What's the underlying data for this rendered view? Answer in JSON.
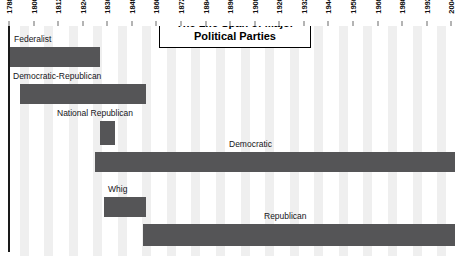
{
  "chart_data": {
    "type": "bar",
    "orientation": "horizontal-timeline",
    "title": "The Life Span of Major Political Parties",
    "xlabel": "",
    "ylabel": "",
    "xlim": [
      1788,
      2010
    ],
    "grid": true,
    "grid_style": "vertical alternating light bands",
    "legend": "none (inline labels above each bar)",
    "tick_interval_years": 12,
    "tick_labels": [
      "1788",
      "1800",
      "1812",
      "1824",
      "1836",
      "1848",
      "1860",
      "1872",
      "1884",
      "1896",
      "1908",
      "1920",
      "1932",
      "1944",
      "1956",
      "1968",
      "1980",
      "1992",
      "2004"
    ],
    "tick_values": [
      1788,
      1800,
      1812,
      1824,
      1836,
      1848,
      1860,
      1872,
      1884,
      1896,
      1908,
      1920,
      1932,
      1944,
      1956,
      1968,
      1980,
      1992,
      2004
    ],
    "bar_color": "#555557",
    "band_color": "#efefef",
    "background_color": "#ffffff",
    "categories": [
      "Federalist",
      "Democratic-Republican",
      "National Republican",
      "Democratic",
      "Whig",
      "Republican"
    ],
    "series": [
      {
        "name": "Life span",
        "spans": [
          {
            "label": "Federalist",
            "start": 1789,
            "end": 1832,
            "row": 0
          },
          {
            "label": "Democratic-Republican",
            "start": 1792,
            "end": 1824,
            "row": 1
          },
          {
            "label": "National Republican",
            "start": 1828,
            "end": 1834,
            "row": 2
          },
          {
            "label": "Democratic",
            "start": 1828,
            "end": 2008,
            "row": 3
          },
          {
            "label": "Whig",
            "start": 1834,
            "end": 1856,
            "row": 4
          },
          {
            "label": "Republican",
            "start": 1854,
            "end": 2008,
            "row": 5
          }
        ]
      }
    ],
    "annotations": [
      {
        "text": "The Life Span of Major Political Parties",
        "type": "title-box"
      }
    ]
  },
  "axis": {
    "ticks": [
      {
        "label": "1788",
        "x": 9
      },
      {
        "label": "1800",
        "x": 34
      },
      {
        "label": "1812",
        "x": 58
      },
      {
        "label": "1824",
        "x": 83
      },
      {
        "label": "1836",
        "x": 107
      },
      {
        "label": "1848",
        "x": 132
      },
      {
        "label": "1860",
        "x": 156
      },
      {
        "label": "1872",
        "x": 181
      },
      {
        "label": "1884",
        "x": 206
      },
      {
        "label": "1896",
        "x": 230
      },
      {
        "label": "1908",
        "x": 255
      },
      {
        "label": "1920",
        "x": 279
      },
      {
        "label": "1932",
        "x": 304
      },
      {
        "label": "1944",
        "x": 328
      },
      {
        "label": "1956",
        "x": 353
      },
      {
        "label": "1968",
        "x": 378
      },
      {
        "label": "1980",
        "x": 402
      },
      {
        "label": "1992",
        "x": 427
      },
      {
        "label": "2004",
        "x": 451
      }
    ]
  },
  "title": {
    "line1": "The Life Span of Major",
    "line2": "Political Parties",
    "full": "The Life Span of Major Political Parties"
  },
  "bars": [
    {
      "name": "federalist",
      "label": "Federalist",
      "x": 10,
      "y": 21,
      "w": 90,
      "h": 20,
      "label_x": 14,
      "label_y": 8
    },
    {
      "name": "democratic-republican",
      "label": "Democratic-Republican",
      "x": 20,
      "y": 58,
      "w": 126,
      "h": 20,
      "label_x": 13,
      "label_y": 45
    },
    {
      "name": "national-republican",
      "label": "National Republican",
      "x": 100,
      "y": 95,
      "w": 15,
      "h": 24,
      "label_x": 57,
      "label_y": 82
    },
    {
      "name": "democratic",
      "label": "Democratic",
      "x": 95,
      "y": 126,
      "w": 360,
      "h": 20,
      "label_x": 229,
      "label_y": 113
    },
    {
      "name": "whig",
      "label": "Whig",
      "x": 104,
      "y": 171,
      "w": 42,
      "h": 20,
      "label_x": 108,
      "label_y": 158
    },
    {
      "name": "republican",
      "label": "Republican",
      "x": 143,
      "y": 198,
      "w": 312,
      "h": 22,
      "label_x": 264,
      "label_y": 185
    }
  ],
  "bands": [
    {
      "x": 20,
      "w": 9
    },
    {
      "x": 44,
      "w": 9
    },
    {
      "x": 69,
      "w": 9
    },
    {
      "x": 93,
      "w": 9
    },
    {
      "x": 118,
      "w": 9
    },
    {
      "x": 142,
      "w": 9
    },
    {
      "x": 167,
      "w": 9
    },
    {
      "x": 191,
      "w": 9
    },
    {
      "x": 216,
      "w": 9
    },
    {
      "x": 241,
      "w": 9
    },
    {
      "x": 265,
      "w": 9
    },
    {
      "x": 290,
      "w": 9
    },
    {
      "x": 314,
      "w": 9
    },
    {
      "x": 339,
      "w": 9
    },
    {
      "x": 363,
      "w": 9
    },
    {
      "x": 388,
      "w": 9
    },
    {
      "x": 413,
      "w": 9
    },
    {
      "x": 437,
      "w": 9
    }
  ]
}
